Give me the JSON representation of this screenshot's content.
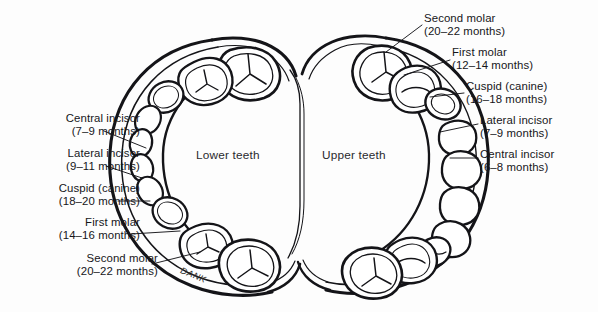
{
  "figure": {
    "background_color": "#fdfdfd",
    "ink_color": "#16161a",
    "signature": "DANK"
  },
  "arches": [
    {
      "id": "lower",
      "name": "Lower teeth",
      "x": 196,
      "y": 148
    },
    {
      "id": "upper",
      "name": "Upper teeth",
      "x": 322,
      "y": 148
    }
  ],
  "labels_left": [
    {
      "id": "lower-central-incisor",
      "tooth": "Central incisor",
      "age": "(7–9 months)",
      "x": 8,
      "y": 112,
      "width": 132,
      "leader": {
        "x1": 104,
        "y1": 131,
        "x2": 146,
        "y2": 148
      }
    },
    {
      "id": "lower-lateral-incisor",
      "tooth": "Lateral incisor",
      "age": "(9–11 months)",
      "x": 8,
      "y": 147,
      "width": 132,
      "leader": {
        "x1": 106,
        "y1": 166,
        "x2": 142,
        "y2": 178
      }
    },
    {
      "id": "lower-cuspid",
      "tooth": "Cuspid (canine)",
      "age": "(18–20 months)",
      "x": 8,
      "y": 182,
      "width": 132,
      "leader": {
        "x1": 118,
        "y1": 201,
        "x2": 150,
        "y2": 201
      }
    },
    {
      "id": "lower-first-molar",
      "tooth": "First molar",
      "age": "(14–16 months)",
      "x": 22,
      "y": 216,
      "width": 118,
      "leader": {
        "x1": 131,
        "y1": 234,
        "x2": 180,
        "y2": 231
      }
    },
    {
      "id": "lower-second-molar",
      "tooth": "Second molar",
      "age": "(20–22 months)",
      "x": 48,
      "y": 252,
      "width": 110,
      "leader": {
        "x1": 152,
        "y1": 264,
        "x2": 200,
        "y2": 252
      }
    }
  ],
  "labels_right": [
    {
      "id": "upper-second-molar",
      "tooth": "Second molar",
      "age": "(20–22 months)",
      "x": 424,
      "y": 12,
      "width": 132,
      "leader": {
        "x1": 422,
        "y1": 25,
        "x2": 386,
        "y2": 52
      }
    },
    {
      "id": "upper-first-molar",
      "tooth": "First molar",
      "age": "(12–14 months)",
      "x": 452,
      "y": 46,
      "width": 130,
      "leader": {
        "x1": 450,
        "y1": 60,
        "x2": 404,
        "y2": 75
      }
    },
    {
      "id": "upper-cuspid",
      "tooth": "Cuspid (canine)",
      "age": "(16–18 months)",
      "x": 466,
      "y": 80,
      "width": 126,
      "leader": {
        "x1": 464,
        "y1": 93,
        "x2": 430,
        "y2": 97
      }
    },
    {
      "id": "upper-lateral-incisor",
      "tooth": "Lateral incisor",
      "age": "(7–9 months)",
      "x": 480,
      "y": 114,
      "width": 112,
      "leader": {
        "x1": 478,
        "y1": 124,
        "x2": 440,
        "y2": 132
      }
    },
    {
      "id": "upper-central-incisor",
      "tooth": "Central incisor",
      "age": "(6–8 months)",
      "x": 480,
      "y": 148,
      "width": 112,
      "leader": {
        "x1": 478,
        "y1": 158,
        "x2": 450,
        "y2": 158
      }
    }
  ]
}
